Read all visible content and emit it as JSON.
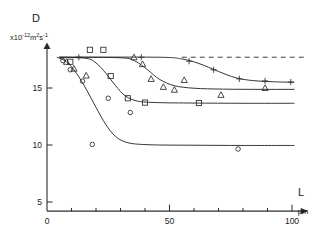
{
  "chart_data": {
    "type": "line",
    "title": "",
    "ylabel": "D",
    "ylabel_units": "x10",
    "ylabel_units_exp": "-12",
    "ylabel_units_tail": "m",
    "ylabel_units_tail_exp": "2",
    "ylabel_units_tail2": "s",
    "ylabel_units_tail2_exp": "-1",
    "xlabel": "L",
    "xlabel_units": "μm",
    "xlim": [
      0,
      108
    ],
    "ylim": [
      4.2,
      19.2
    ],
    "xticks": [
      0,
      50,
      100
    ],
    "xtick_labels": [
      "0",
      "50",
      "100"
    ],
    "xminor_step": 10,
    "yticks": [
      5,
      10,
      15
    ],
    "ytick_labels": [
      "5",
      "10",
      "15"
    ],
    "grid": false,
    "legend": "none",
    "plateau_value": 17.7,
    "reference_line": {
      "label": "bulk-diffusivity-dashed-reference",
      "y": 17.7,
      "x_start": 55,
      "x_end": 105,
      "style": "dashed"
    },
    "series": [
      {
        "name": "plus-series",
        "marker": "plus",
        "plateau_high": 17.7,
        "plateau_low": 15.5,
        "points": [
          {
            "x": 13.0,
            "y": 17.7
          },
          {
            "x": 38.5,
            "y": 17.7
          },
          {
            "x": 58.0,
            "y": 17.35
          },
          {
            "x": 68.0,
            "y": 16.6
          },
          {
            "x": 78.5,
            "y": 15.8
          },
          {
            "x": 89.0,
            "y": 15.62
          },
          {
            "x": 99.5,
            "y": 15.52
          }
        ],
        "curve": [
          {
            "x": 5.0,
            "y": 17.7
          },
          {
            "x": 45.0,
            "y": 17.7
          },
          {
            "x": 55.0,
            "y": 17.55
          },
          {
            "x": 62.0,
            "y": 17.15
          },
          {
            "x": 70.0,
            "y": 16.45
          },
          {
            "x": 77.0,
            "y": 15.9
          },
          {
            "x": 84.0,
            "y": 15.65
          },
          {
            "x": 92.0,
            "y": 15.55
          },
          {
            "x": 101.0,
            "y": 15.5
          }
        ]
      },
      {
        "name": "triangle-series",
        "marker": "triangle",
        "plateau_high": 17.7,
        "plateau_low": 14.9,
        "points": [
          {
            "x": 8.0,
            "y": 17.3
          },
          {
            "x": 11.0,
            "y": 16.7
          },
          {
            "x": 16.0,
            "y": 16.1
          },
          {
            "x": 35.5,
            "y": 17.7
          },
          {
            "x": 39.0,
            "y": 17.1
          },
          {
            "x": 42.5,
            "y": 15.8
          },
          {
            "x": 47.5,
            "y": 15.1
          },
          {
            "x": 52.0,
            "y": 14.85
          },
          {
            "x": 56.0,
            "y": 15.7
          },
          {
            "x": 71.0,
            "y": 14.4
          },
          {
            "x": 89.0,
            "y": 15.0
          }
        ],
        "curve": [
          {
            "x": 5.0,
            "y": 17.7
          },
          {
            "x": 30.0,
            "y": 17.65
          },
          {
            "x": 36.0,
            "y": 17.35
          },
          {
            "x": 41.0,
            "y": 16.6
          },
          {
            "x": 46.0,
            "y": 15.75
          },
          {
            "x": 52.0,
            "y": 15.2
          },
          {
            "x": 60.0,
            "y": 14.98
          },
          {
            "x": 72.0,
            "y": 14.9
          },
          {
            "x": 88.0,
            "y": 14.88
          },
          {
            "x": 101.0,
            "y": 14.88
          }
        ]
      },
      {
        "name": "square-series",
        "marker": "square",
        "plateau_high": 17.7,
        "plateau_low": 13.7,
        "points": [
          {
            "x": 9.5,
            "y": 17.3
          },
          {
            "x": 17.5,
            "y": 18.35
          },
          {
            "x": 23.0,
            "y": 18.35
          },
          {
            "x": 26.0,
            "y": 16.05
          },
          {
            "x": 33.0,
            "y": 14.1
          },
          {
            "x": 40.0,
            "y": 13.72
          },
          {
            "x": 62.0,
            "y": 13.68
          }
        ],
        "curve": [
          {
            "x": 5.0,
            "y": 17.7
          },
          {
            "x": 16.0,
            "y": 17.6
          },
          {
            "x": 20.0,
            "y": 17.2
          },
          {
            "x": 24.0,
            "y": 16.3
          },
          {
            "x": 28.0,
            "y": 15.2
          },
          {
            "x": 32.0,
            "y": 14.3
          },
          {
            "x": 37.0,
            "y": 13.85
          },
          {
            "x": 45.0,
            "y": 13.72
          },
          {
            "x": 60.0,
            "y": 13.68
          },
          {
            "x": 80.0,
            "y": 13.66
          },
          {
            "x": 101.0,
            "y": 13.66
          }
        ]
      },
      {
        "name": "circle-series",
        "marker": "circle",
        "plateau_high": 17.7,
        "plateau_low": 10.0,
        "points": [
          {
            "x": 6.5,
            "y": 17.4
          },
          {
            "x": 9.5,
            "y": 16.6
          },
          {
            "x": 14.5,
            "y": 15.6
          },
          {
            "x": 25.0,
            "y": 14.1
          },
          {
            "x": 34.0,
            "y": 12.85
          },
          {
            "x": 18.5,
            "y": 10.05
          },
          {
            "x": 78.0,
            "y": 9.65
          }
        ],
        "curve": [
          {
            "x": 4.0,
            "y": 17.7
          },
          {
            "x": 8.0,
            "y": 17.3
          },
          {
            "x": 12.0,
            "y": 16.3
          },
          {
            "x": 16.0,
            "y": 14.9
          },
          {
            "x": 20.0,
            "y": 13.3
          },
          {
            "x": 24.0,
            "y": 11.8
          },
          {
            "x": 28.0,
            "y": 10.75
          },
          {
            "x": 33.0,
            "y": 10.2
          },
          {
            "x": 42.0,
            "y": 10.02
          },
          {
            "x": 60.0,
            "y": 9.98
          },
          {
            "x": 80.0,
            "y": 9.96
          },
          {
            "x": 101.0,
            "y": 9.96
          }
        ]
      }
    ]
  }
}
